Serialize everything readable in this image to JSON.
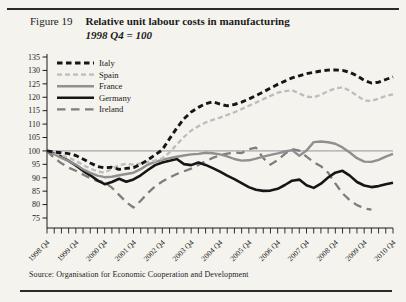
{
  "page": {
    "figure_label": "Figure 19",
    "title": "Relative unit labour costs in manufacturing",
    "subtitle": "1998 Q4 = 100",
    "source": "Source: Organisation for Economic Cooperation and Development"
  },
  "chart_data": {
    "type": "line",
    "title": "Relative unit labour costs in manufacturing",
    "subtitle": "1998 Q4 = 100",
    "xlabel": "",
    "ylabel": "",
    "ylim": [
      75,
      135
    ],
    "y_ticks": [
      75,
      80,
      85,
      90,
      95,
      100,
      105,
      110,
      115,
      120,
      125,
      130,
      135
    ],
    "reference_line": 100,
    "grid": false,
    "legend_position": "top-left",
    "x_unit": "quarter",
    "x_quarters_total": 49,
    "x_tick_labels": [
      "1998 Q4",
      "1999 Q4",
      "2000 Q4",
      "2001 Q4",
      "2002 Q4",
      "2003 Q4",
      "2004 Q4",
      "2005 Q4",
      "2006 Q4",
      "2007 Q4",
      "2008 Q4",
      "2009 Q4",
      "2010 Q4"
    ],
    "axis_color": "#1b1b1b",
    "reference_line_color": "#8a8a8a",
    "series": [
      {
        "name": "Italy",
        "color": "#161616",
        "dash": "5.5,3.5",
        "width": 2.9,
        "values": [
          100,
          99.6,
          99.3,
          99,
          98.3,
          97,
          95.5,
          94.2,
          93.7,
          93.9,
          93.1,
          93.5,
          93.8,
          95,
          96.7,
          98.5,
          100.4,
          104.5,
          108.5,
          112,
          114.5,
          116.2,
          117.6,
          118.3,
          117.4,
          116.8,
          117.3,
          118.2,
          119.3,
          120.6,
          122,
          123.4,
          124.8,
          126,
          127.2,
          128,
          128.8,
          129.3,
          129.8,
          130.1,
          130.2,
          130,
          129.3,
          128,
          126.3,
          125.3,
          125.6,
          126.6,
          127.6
        ]
      },
      {
        "name": "Spain",
        "color": "#bdbdbd",
        "dash": "5,3",
        "width": 2.3,
        "values": [
          100,
          99.2,
          98.4,
          97.4,
          96.4,
          94.8,
          93.4,
          92.4,
          91.9,
          93.4,
          94.7,
          95.2,
          94.9,
          95.4,
          95.9,
          96.4,
          97.2,
          99.4,
          102.4,
          105.2,
          107.6,
          109.2,
          110.6,
          111.6,
          112.4,
          113.4,
          114.4,
          115.6,
          116.8,
          118,
          119.3,
          120.5,
          121.7,
          122.3,
          122.6,
          121.4,
          120.2,
          120,
          120.9,
          122.3,
          123.3,
          123.7,
          122.4,
          120.6,
          118.8,
          118.6,
          119.5,
          120.5,
          121.1
        ]
      },
      {
        "name": "France",
        "color": "#909090",
        "dash": "",
        "width": 2.4,
        "values": [
          100,
          98.8,
          97.4,
          96.2,
          94.9,
          93.2,
          91.8,
          90.8,
          90.2,
          90.4,
          90.9,
          91.4,
          91.9,
          93.2,
          94.9,
          95.9,
          96.7,
          97.3,
          97.8,
          98.3,
          98.7,
          98.9,
          99.3,
          99.1,
          98.7,
          98,
          97,
          96.4,
          96.5,
          97.1,
          97.9,
          98.5,
          99.1,
          99.8,
          100.3,
          98.2,
          100.1,
          103.3,
          103.5,
          103.2,
          102.7,
          101.3,
          99.4,
          97.3,
          96,
          95.9,
          96.7,
          97.9,
          98.9
        ]
      },
      {
        "name": "Germany",
        "color": "#161616",
        "dash": "",
        "width": 2.6,
        "values": [
          100,
          99,
          97.8,
          96.3,
          94.6,
          92.6,
          90.9,
          89,
          87.6,
          88.4,
          89.6,
          88.5,
          89.4,
          90.9,
          92.9,
          94.7,
          95.7,
          96.3,
          97,
          95.1,
          94.7,
          95.7,
          94.8,
          93.6,
          92.3,
          90.8,
          89.5,
          88,
          86.5,
          85.5,
          85.1,
          85.2,
          85.9,
          87.3,
          88.9,
          89.3,
          87.2,
          86.2,
          87.8,
          90.1,
          91.9,
          92.6,
          90.8,
          88.4,
          87.1,
          86.5,
          86.9,
          87.6,
          88.1
        ]
      },
      {
        "name": "Ireland",
        "color": "#7e7e7e",
        "dash": "8.5,5.5",
        "width": 2.3,
        "values": [
          100,
          97.4,
          95.4,
          93.8,
          92.6,
          91.2,
          89.8,
          88.8,
          88.3,
          86.3,
          83.6,
          80.9,
          78.9,
          81.4,
          84.3,
          86.8,
          88.6,
          90.1,
          91.4,
          92.4,
          93.4,
          94.8,
          96.2,
          97.4,
          98.4,
          99,
          99.4,
          99.2,
          100.6,
          101.2,
          97.3,
          94.9,
          96.6,
          98.9,
          100.7,
          100.1,
          97.9,
          95.8,
          94.3,
          91.9,
          87.9,
          84.2,
          81.6,
          79.8,
          78.6,
          78.1
        ]
      }
    ]
  }
}
